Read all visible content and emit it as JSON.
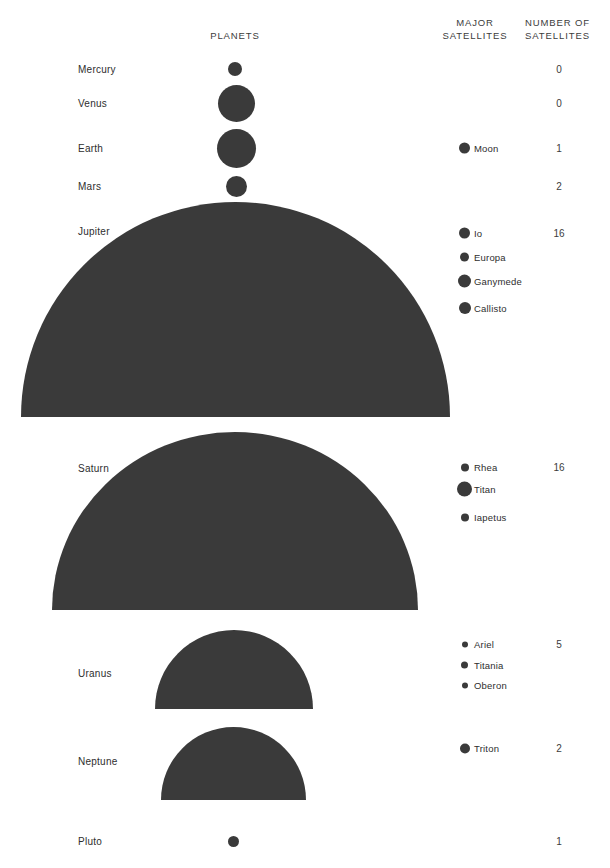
{
  "headers": {
    "planets": "PLANETS",
    "major_satellites": "MAJOR\nSATELLITES",
    "number_of_satellites": "NUMBER OF\nSATELLITES"
  },
  "colors": {
    "body_fill": "#3a3a3a",
    "text": "#2e2e2e",
    "background": "#ffffff"
  },
  "chart_data": {
    "type": "table",
    "title": "PLANETS",
    "columns": [
      "PLANETS",
      "MAJOR SATELLITES",
      "NUMBER OF SATELLITES"
    ],
    "note": "Relative planet sizes drawn to scale; small planets as full circles, giant planets as half-domes.",
    "rows": [
      {
        "planet": "Mercury",
        "shape": "circle",
        "diameter_px": 14,
        "center_x": 235,
        "center_y": 69,
        "satellite_count": "0",
        "satellites": []
      },
      {
        "planet": "Venus",
        "shape": "circle",
        "diameter_px": 37,
        "center_x": 236,
        "center_y": 103,
        "satellite_count": "0",
        "satellites": []
      },
      {
        "planet": "Earth",
        "shape": "circle",
        "diameter_px": 39,
        "center_x": 236,
        "center_y": 148,
        "satellite_count": "1",
        "satellites": [
          {
            "name": "Moon",
            "dot_px": 11,
            "y": 148
          }
        ]
      },
      {
        "planet": "Mars",
        "shape": "circle",
        "diameter_px": 21,
        "center_x": 236,
        "center_y": 186,
        "satellite_count": "2",
        "satellites": []
      },
      {
        "planet": "Jupiter",
        "shape": "dome",
        "left": 21,
        "width": 429,
        "bottom_y": 417,
        "height": 215,
        "label_y": 231,
        "satellite_count": "16",
        "count_y": 233,
        "satellites": [
          {
            "name": "Io",
            "dot_px": 11,
            "y": 233
          },
          {
            "name": "Europa",
            "dot_px": 9,
            "y": 257
          },
          {
            "name": "Ganymede",
            "dot_px": 13,
            "y": 281
          },
          {
            "name": "Callisto",
            "dot_px": 12,
            "y": 308
          }
        ]
      },
      {
        "planet": "Saturn",
        "shape": "dome",
        "left": 52,
        "width": 366,
        "bottom_y": 610,
        "height": 178,
        "label_y": 468,
        "satellite_count": "16",
        "count_y": 467,
        "satellites": [
          {
            "name": "Rhea",
            "dot_px": 8,
            "y": 467
          },
          {
            "name": "Titan",
            "dot_px": 15,
            "y": 489
          },
          {
            "name": "Iapetus",
            "dot_px": 8,
            "y": 517
          }
        ]
      },
      {
        "planet": "Uranus",
        "shape": "dome",
        "left": 155,
        "width": 158,
        "bottom_y": 709,
        "height": 79,
        "label_y": 673,
        "satellite_count": "5",
        "count_y": 644,
        "satellites": [
          {
            "name": "Ariel",
            "dot_px": 6,
            "y": 644
          },
          {
            "name": "Titania",
            "dot_px": 7,
            "y": 665
          },
          {
            "name": "Oberon",
            "dot_px": 6,
            "y": 685
          }
        ]
      },
      {
        "planet": "Neptune",
        "shape": "dome",
        "left": 161,
        "width": 145,
        "bottom_y": 800,
        "height": 73,
        "label_y": 761,
        "satellite_count": "2",
        "count_y": 748,
        "satellites": [
          {
            "name": "Triton",
            "dot_px": 10,
            "y": 748
          }
        ]
      },
      {
        "planet": "Pluto",
        "shape": "circle",
        "diameter_px": 11,
        "center_x": 233,
        "center_y": 841,
        "satellite_count": "1",
        "satellites": []
      }
    ]
  }
}
